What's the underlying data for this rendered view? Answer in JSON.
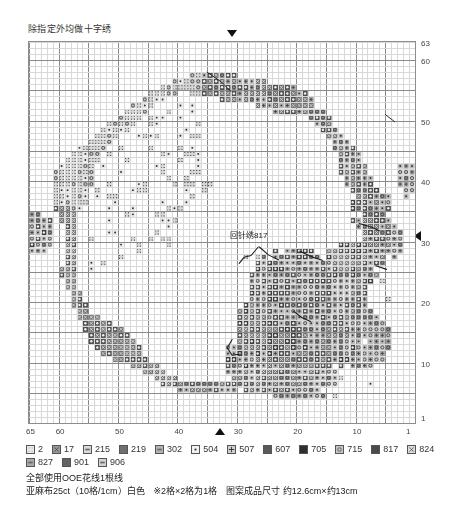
{
  "notes": {
    "top": "除指定外均做十字绣"
  },
  "chart_data": {
    "type": "heatmap",
    "title": "除指定外均做十字绣",
    "grid": {
      "cols": 65,
      "rows": 63,
      "cell_px": 5.95,
      "bold_every": 5
    },
    "xlabel": "",
    "ylabel": "",
    "x_axis": {
      "labels": [
        "65",
        "60",
        "50",
        "40",
        "30",
        "20",
        "10",
        "1"
      ],
      "values": [
        65,
        60,
        50,
        40,
        30,
        20,
        10,
        1
      ],
      "direction": "right-to-left",
      "marker": {
        "symbol": "▲",
        "at": 35
      }
    },
    "y_axis": {
      "labels": [
        "63",
        "60",
        "50",
        "40",
        "30",
        "20",
        "10",
        "1"
      ],
      "values": [
        63,
        60,
        50,
        40,
        30,
        20,
        10,
        1
      ],
      "direction": "bottom-to-top",
      "marker": {
        "symbol": "◀",
        "at": 32
      }
    },
    "top_marker": {
      "symbol": "▼",
      "at": 33
    },
    "legend_position": "below-chart",
    "grid_on": true,
    "annotations": [
      {
        "text": "回针绣817",
        "x": 34,
        "y": 33
      }
    ],
    "palette_note": "Greyscale printed chart; each DMC/OOE code is rendered with a distinct symbol + fill density."
  },
  "legend": {
    "rows": [
      [
        {
          "code": "2",
          "symbol": "dotted-square",
          "fill": "#e8e8e8"
        },
        {
          "code": "17",
          "symbol": "x-square",
          "fill": "#9a9a9a"
        },
        {
          "code": "215",
          "symbol": "light-square",
          "fill": "#d9d9d9"
        },
        {
          "code": "219",
          "symbol": "dark-square",
          "fill": "#6f6f6f"
        },
        {
          "code": "302",
          "symbol": "mid-square",
          "fill": "#b4b4b4"
        },
        {
          "code": "504",
          "symbol": "dot-square",
          "fill": "#f0f0f0"
        },
        {
          "code": "507",
          "symbol": "grid-square",
          "fill": "#cfcfcf"
        },
        {
          "code": "607",
          "symbol": "darker-square",
          "fill": "#5a5a5a"
        },
        {
          "code": "705",
          "symbol": "black-square",
          "fill": "#2f2f2f"
        },
        {
          "code": "715",
          "symbol": "ring-square",
          "fill": "#c6c6c6"
        },
        {
          "code": "817",
          "symbol": "solid-square",
          "fill": "#4a4a4a"
        },
        {
          "code": "824",
          "symbol": "cross-square",
          "fill": "#dedede"
        }
      ],
      [
        {
          "code": "827",
          "symbol": "mid2-square",
          "fill": "#a8a8a8"
        },
        {
          "code": "901",
          "symbol": "dark2-square",
          "fill": "#646464"
        },
        {
          "code": "906",
          "symbol": "light2-square",
          "fill": "#d2d2d2"
        }
      ]
    ]
  },
  "footnotes": {
    "line1": "全部使用OOE花线1根线",
    "line2": "亚麻布25ct（10格/1cm）白色　※2格×2格为1格　图案成品尺寸 约12.6cm×约13cm"
  }
}
